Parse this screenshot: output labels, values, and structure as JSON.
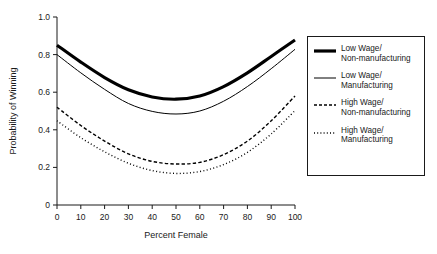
{
  "chart_data": {
    "type": "line",
    "title": "",
    "xlabel": "Percent Female",
    "ylabel": "Probability of Winning",
    "xlim": [
      0,
      100
    ],
    "ylim": [
      0,
      1.0
    ],
    "grid": false,
    "legend_position": "right",
    "xticks": [
      "0",
      "10",
      "20",
      "30",
      "40",
      "50",
      "60",
      "70",
      "80",
      "90",
      "100"
    ],
    "xtick_values": [
      0,
      10,
      20,
      30,
      40,
      50,
      60,
      70,
      80,
      90,
      100
    ],
    "yticks": [
      "0",
      "0.2",
      "0.4",
      "0.6",
      "0.8",
      "1.0"
    ],
    "ytick_values": [
      0,
      0.2,
      0.4,
      0.6,
      0.8,
      1.0
    ],
    "x": [
      0,
      10,
      20,
      30,
      40,
      50,
      60,
      70,
      80,
      90,
      100
    ],
    "series": [
      {
        "name": "Low Wage/\nNon-manufacturing",
        "style": "solid-thick",
        "color": "#000000",
        "width": 3.1,
        "values": [
          0.85,
          0.76,
          0.678,
          0.613,
          0.575,
          0.563,
          0.58,
          0.63,
          0.703,
          0.79,
          0.878
        ]
      },
      {
        "name": "Low Wage/\nManufacturing",
        "style": "solid-thin",
        "color": "#000000",
        "width": 1.0,
        "values": [
          0.8,
          0.703,
          0.615,
          0.54,
          0.498,
          0.484,
          0.5,
          0.552,
          0.63,
          0.725,
          0.828
        ]
      },
      {
        "name": "High Wage/\nNon-manufacturing",
        "style": "dashed",
        "color": "#000000",
        "width": 1.4,
        "values": [
          0.52,
          0.423,
          0.34,
          0.272,
          0.232,
          0.218,
          0.227,
          0.268,
          0.34,
          0.448,
          0.58
        ]
      },
      {
        "name": "High Wage/\nManufacturing",
        "style": "dotted",
        "color": "#000000",
        "width": 1.4,
        "values": [
          0.448,
          0.358,
          0.283,
          0.222,
          0.183,
          0.168,
          0.178,
          0.215,
          0.28,
          0.378,
          0.502
        ]
      }
    ]
  },
  "legend": {
    "entries": [
      {
        "label": "Low Wage/\nNon-manufacturing"
      },
      {
        "label": "Low Wage/\nManufacturing"
      },
      {
        "label": "High Wage/\nNon-manufacturing"
      },
      {
        "label": "High Wage/\nManufacturing"
      }
    ]
  }
}
